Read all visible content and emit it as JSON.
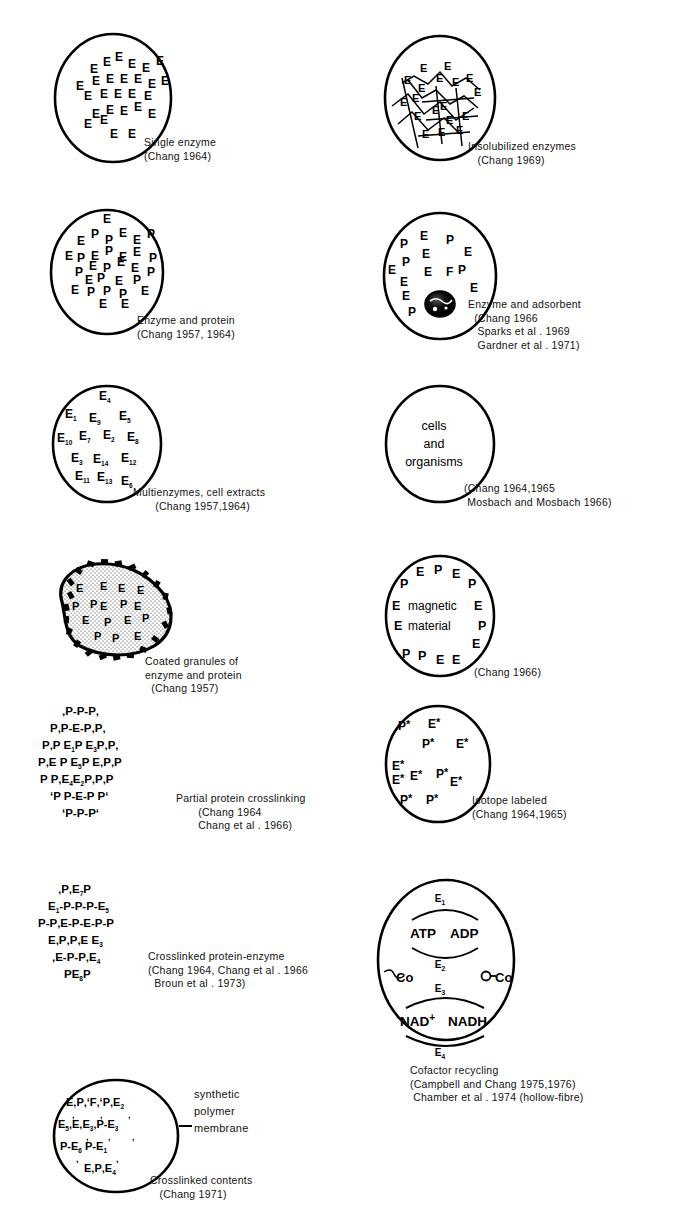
{
  "figure": {
    "panel_count": 13
  },
  "panels": [
    {
      "id": "single-enzyme",
      "caption_lines": [
        "Single enzyme",
        "(Chang 1964)"
      ],
      "shape": "circle",
      "contents": [
        "E",
        "E",
        "E",
        "E",
        "E",
        "E",
        "E",
        "E",
        "E",
        "E",
        "E",
        "E",
        "E",
        "E",
        "E",
        "E",
        "E",
        "E",
        "E",
        "E",
        "E",
        "E",
        "E",
        "E"
      ]
    },
    {
      "id": "insolubilized-enzymes",
      "caption_lines": [
        "Insolubilized enzymes",
        "(Chang 1969)"
      ],
      "shape": "circle-with-crosslinks",
      "contents": [
        "E",
        "E",
        "E",
        "E",
        "E",
        "E",
        "E",
        "E",
        "E",
        "E",
        "E",
        "E"
      ]
    },
    {
      "id": "enzyme-and-protein",
      "caption_lines": [
        "Enzyme and protein",
        "(Chang 1957, 1964)"
      ],
      "shape": "circle",
      "contents": [
        "E",
        "P",
        "E",
        "P",
        "E",
        "P",
        "E",
        "P",
        "E",
        "P",
        "E",
        "P",
        "E",
        "P",
        "E",
        "P",
        "E",
        "P",
        "E",
        "P",
        "E",
        "P",
        "E",
        "P",
        "E"
      ]
    },
    {
      "id": "enzyme-and-adsorbent",
      "caption_lines": [
        "Enzyme and adsorbent",
        "(Chang 1966",
        "Sparks et al . 1969",
        "Gardner et al . 1971)"
      ],
      "shape": "circle-with-adsorbent-granule",
      "contents": [
        "P",
        "E",
        "E",
        "P",
        "P",
        "E",
        "E",
        "E",
        "E",
        "E",
        "E",
        "F",
        "P",
        "E",
        "E",
        "P"
      ]
    },
    {
      "id": "multienzymes-cell-extracts",
      "caption_lines": [
        "Multienzymes, cell extracts",
        "(Chang 1957,1964)"
      ],
      "shape": "circle",
      "contents": [
        "E4",
        "E1",
        "E9",
        "E5",
        "E10",
        "E7",
        "E2",
        "E8",
        "E3",
        "E14",
        "E12",
        "E11",
        "E13",
        "E6"
      ]
    },
    {
      "id": "cells-and-organisms",
      "caption_lines": [
        "(Chang 1964,1965",
        "Mosbach and Mosbach 1966)"
      ],
      "shape": "circle",
      "inner_text": [
        "cells",
        "and",
        "organisms"
      ]
    },
    {
      "id": "coated-granules",
      "caption_lines": [
        "Coated granules of",
        "enzyme and protein",
        "(Chang 1957)"
      ],
      "shape": "coated-granule",
      "contents": [
        "E",
        "E",
        "E",
        "E",
        "P",
        "E",
        "P",
        "E",
        "E",
        "P",
        "E",
        "P",
        "E"
      ]
    },
    {
      "id": "magnetic-material",
      "caption_lines": [
        "(Chang 1966)"
      ],
      "shape": "circle",
      "inner_text": [
        "magnetic",
        "material"
      ],
      "contents": [
        "E",
        "P",
        "E",
        "P",
        "P",
        "E",
        "E",
        "E",
        "P",
        "P",
        "P",
        "E",
        "E",
        "E"
      ]
    },
    {
      "id": "partial-protein-crosslinking",
      "caption_lines": [
        "Partial protein crosslinking",
        "(Chang 1964",
        "Chang et al . 1966)"
      ],
      "shape": "crosslinked-cluster",
      "rows": [
        "P-P-P",
        "P P-E-P P",
        "P P E1 P E3 P P",
        "P E P E5 P E P P",
        "P P E4 E2 P P P",
        "P P-E-P P",
        "P-P-P"
      ]
    },
    {
      "id": "isotope-labeled",
      "caption_lines": [
        "Isotope labeled",
        "(Chang 1964,1965)"
      ],
      "shape": "circle",
      "contents": [
        "P*",
        "E*",
        "P*",
        "E*",
        "E*",
        "E*",
        "E*",
        "P*",
        "E*",
        "P*",
        "P*"
      ]
    },
    {
      "id": "crosslinked-protein-enzyme",
      "caption_lines": [
        "Crosslinked protein-enzyme",
        "(Chang 1964, Chang et al . 1966",
        "Broun et al . 1973)"
      ],
      "shape": "crosslinked-cluster",
      "rows": [
        "P E7 P",
        "E1 P-P-P-E5",
        "P-P E-P-E-P-P",
        "E P P E E3",
        "E-P-P E4",
        "P E8 P"
      ]
    },
    {
      "id": "cofactor-recycling",
      "caption_lines": [
        "Cofactor recycling",
        "(Campbell and Chang 1975,1976)",
        "Chamber et al . 1974 (hollow-fibre)"
      ],
      "shape": "circle-cofactor",
      "enzymes": [
        "E1",
        "E2",
        "E3",
        "E4"
      ],
      "metabolites": [
        "ATP",
        "ADP",
        "NAD",
        "NADH"
      ],
      "nad_superscript": "+",
      "cofactor_left": "Co",
      "cofactor_right": "O-Co"
    },
    {
      "id": "crosslinked-contents",
      "caption_lines": [
        "Crosslinked contents",
        "(Chang 1971)"
      ],
      "shape": "circle",
      "annotation_lines": [
        "synthetic",
        "polymer",
        "membrane"
      ],
      "rows": [
        "E-P-P-F-P-E2",
        "E5-E-E3-P-E3",
        "P-E6 P-E1",
        "E-P-E4"
      ]
    }
  ]
}
